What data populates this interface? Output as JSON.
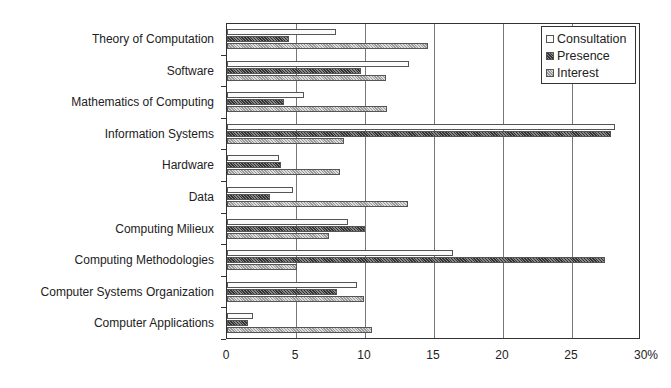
{
  "chart_data": {
    "type": "bar",
    "orientation": "horizontal",
    "title": "",
    "xlabel": "",
    "ylabel": "",
    "xlim": [
      0,
      30
    ],
    "x_unit": "%",
    "x_ticks": [
      "0",
      "5",
      "10",
      "15",
      "20",
      "25",
      "30%"
    ],
    "grid": true,
    "legend_position": "top-right inside",
    "categories": [
      "Theory of Computation",
      "Software",
      "Mathematics of Computing",
      "Information Systems",
      "Hardware",
      "Data",
      "Computing Milieux",
      "Computing Methodologies",
      "Computer Systems Organization",
      "Computer Applications"
    ],
    "series": [
      {
        "name": "Consultation",
        "values": [
          7.9,
          13.2,
          5.6,
          28.1,
          3.8,
          4.8,
          8.8,
          16.4,
          9.4,
          1.9
        ]
      },
      {
        "name": "Presence",
        "values": [
          4.5,
          9.7,
          4.1,
          27.8,
          3.9,
          3.1,
          10.0,
          27.4,
          8.0,
          1.5
        ]
      },
      {
        "name": "Interest",
        "values": [
          14.6,
          11.5,
          11.6,
          8.5,
          8.2,
          13.1,
          7.4,
          5.1,
          9.9,
          10.5
        ]
      }
    ]
  },
  "legend": {
    "items": [
      {
        "label": "Consultation",
        "key": "consultation"
      },
      {
        "label": "Presence",
        "key": "presence"
      },
      {
        "label": "Interest",
        "key": "interest"
      }
    ]
  }
}
